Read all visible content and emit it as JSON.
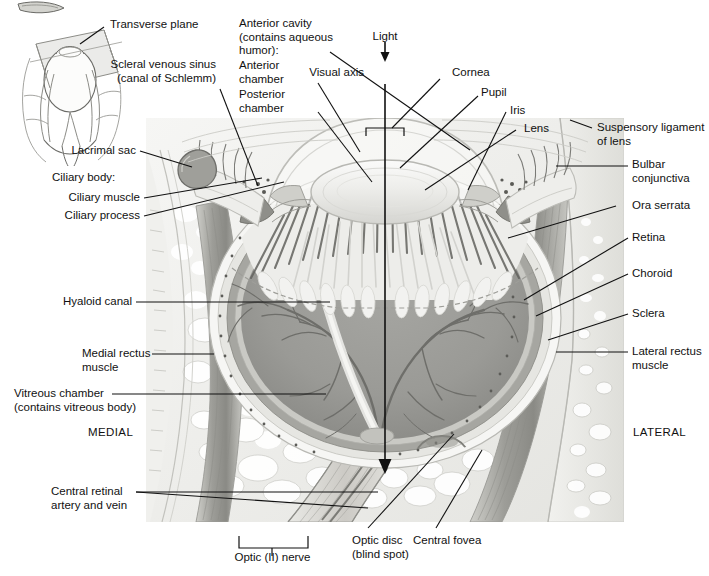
{
  "figure": {
    "orientation": {
      "medial": "MEDIAL",
      "lateral": "LATERAL"
    },
    "inset_label": "Transverse plane"
  },
  "labels": {
    "transverse_plane": "Transverse plane",
    "lacrimal_sac": "Lacrimal sac",
    "scleral_venous_sinus": "Scleral venous sinus\n(canal of Schlemm)",
    "anterior_cavity": "Anterior cavity\n(contains aqueous\nhumor):",
    "anterior_chamber": "Anterior\nchamber",
    "posterior_chamber": "Posterior\nchamber",
    "light": "Light",
    "visual_axis": "Visual axis",
    "cornea": "Cornea",
    "pupil": "Pupil",
    "iris": "Iris",
    "lens": "Lens",
    "suspensory_ligament": "Suspensory ligament\nof lens",
    "bulbar_conjunctiva": "Bulbar\nconjunctiva",
    "ora_serrata": "Ora serrata",
    "retina": "Retina",
    "choroid": "Choroid",
    "sclera": "Sclera",
    "lateral_rectus_muscle": "Lateral rectus\nmuscle",
    "ciliary_body": "Ciliary body:",
    "ciliary_muscle": "Ciliary muscle",
    "ciliary_process": "Ciliary process",
    "hyaloid_canal": "Hyaloid canal",
    "medial_rectus_muscle": "Medial rectus\nmuscle",
    "vitreous_chamber": "Vitreous chamber\n(contains vitreous body)",
    "medial": "MEDIAL",
    "lateral": "LATERAL",
    "central_retinal_vessels": "Central retinal\nartery and vein",
    "optic_nerve": "Optic (II) nerve",
    "optic_disc": "Optic disc\n(blind spot)",
    "central_fovea": "Central fovea"
  },
  "colors": {
    "ink": "#111111",
    "leader": "#1a1a1a",
    "background": "#ffffff",
    "sclera_outer": "#f2f2f0",
    "sclera_band": "#dcdcd8",
    "choroid_band": "#a9a9a4",
    "retina_band": "#cfcfc9",
    "vitreous": "#9a9a96",
    "vitreous_dark": "#8b8b87",
    "vessel": "#6e6e6a",
    "ciliary_fan_light": "#ededea",
    "ciliary_fan_dark": "#5c5c58",
    "lens_body": "#f4f4f2",
    "lens_edge": "#c8c8c4",
    "orbit_fat": "#efefec",
    "bone": "#e6e6e2",
    "muscle": "#b6b6b1",
    "muscle_dark": "#8e8e89",
    "nerve": "#d6d6d1",
    "eyelid": "#e9e9e6",
    "inset_plane": "#e5e5e2",
    "inset_line": "#4a4a4a"
  }
}
